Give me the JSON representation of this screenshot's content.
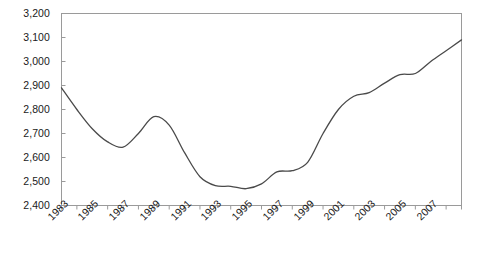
{
  "chart_data": {
    "type": "line",
    "title": "",
    "subtitle": "",
    "xlabel": "",
    "ylabel": "",
    "grid": false,
    "legend": "none",
    "line_color": "#4a4a4a",
    "frame_color": "#9a9a9a",
    "ylim": [
      2400,
      3200
    ],
    "ytick_step": 100,
    "ytick_labels": [
      "3,200",
      "3,100",
      "3,000",
      "2,900",
      "2,800",
      "2,700",
      "2,600",
      "2,500",
      "2,400"
    ],
    "ytick_values": [
      3200,
      3100,
      3000,
      2900,
      2800,
      2700,
      2600,
      2500,
      2400
    ],
    "xlim": [
      1983,
      2009
    ],
    "xtick_labels": [
      "1983",
      "1985",
      "1987",
      "1989",
      "1991",
      "1993",
      "1995",
      "1997",
      "1999",
      "2001",
      "2003",
      "2005",
      "2007"
    ],
    "xtick_values": [
      1983,
      1985,
      1987,
      1989,
      1991,
      1993,
      1995,
      1997,
      1999,
      2001,
      2003,
      2005,
      2007
    ],
    "x": [
      1983,
      1984,
      1985,
      1986,
      1987,
      1988,
      1989,
      1990,
      1991,
      1992,
      1993,
      1994,
      1995,
      1996,
      1997,
      1998,
      1999,
      2000,
      2001,
      2002,
      2003,
      2004,
      2005,
      2006,
      2007,
      2008,
      2009
    ],
    "values": [
      2890,
      2800,
      2720,
      2665,
      2643,
      2700,
      2770,
      2735,
      2620,
      2520,
      2483,
      2480,
      2470,
      2490,
      2540,
      2545,
      2580,
      2700,
      2800,
      2855,
      2870,
      2910,
      2945,
      2950,
      3000,
      3045,
      3090
    ],
    "series": [
      {
        "name": "series-1",
        "values": [
          2890,
          2800,
          2720,
          2665,
          2643,
          2700,
          2770,
          2735,
          2620,
          2520,
          2483,
          2480,
          2470,
          2490,
          2540,
          2545,
          2580,
          2700,
          2800,
          2855,
          2870,
          2910,
          2945,
          2950,
          3000,
          3045,
          3090
        ]
      }
    ],
    "annotations": []
  }
}
